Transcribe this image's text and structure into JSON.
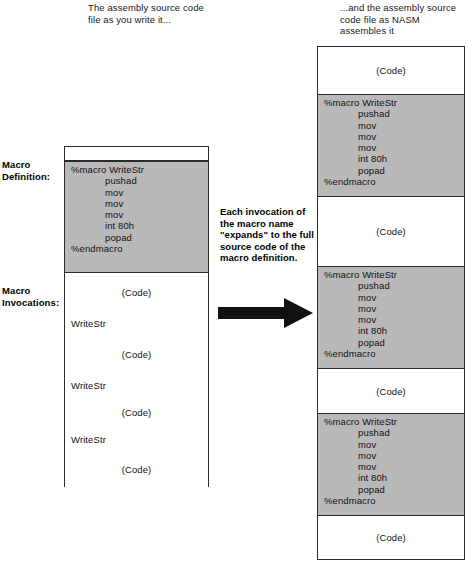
{
  "captions": {
    "left": "The assembly source code file as you write it...",
    "right": "...and the assembly source code file as NASM assembles it"
  },
  "labels": {
    "macro_definition": "Macro Definition:",
    "macro_invocations": "Macro Invocations:"
  },
  "center": {
    "note": "Each invocation of the macro name \"expands\" to the full source code of the macro definition.",
    "arrow_direction": "right"
  },
  "colors": {
    "macro_block_fill": "#b9b9b9",
    "code_block_fill": "#ffffff",
    "border": "#2b2b2b",
    "arrow": "#111111"
  },
  "macro_block": {
    "lines": [
      "%macro WriteStr",
      "pushad",
      "mov",
      "mov",
      "mov",
      "int 80h",
      "popad",
      "%endmacro"
    ],
    "indented": [
      false,
      true,
      true,
      true,
      true,
      true,
      true,
      false
    ]
  },
  "code_placeholder": "(Code)",
  "invocation_name": "WriteStr",
  "left_column": {
    "segments": [
      {
        "type": "blank"
      },
      {
        "type": "macro"
      },
      {
        "type": "code",
        "text": "(Code)"
      },
      {
        "type": "invoke",
        "text": "WriteStr"
      },
      {
        "type": "code",
        "text": "(Code)"
      },
      {
        "type": "invoke",
        "text": "WriteStr"
      },
      {
        "type": "code",
        "text": "(Code)"
      },
      {
        "type": "invoke",
        "text": "WriteStr"
      },
      {
        "type": "code",
        "text": "(Code)"
      }
    ]
  },
  "right_column": {
    "segments": [
      {
        "type": "code",
        "text": "(Code)"
      },
      {
        "type": "macro"
      },
      {
        "type": "code",
        "text": "(Code)"
      },
      {
        "type": "macro"
      },
      {
        "type": "code",
        "text": "(Code)"
      },
      {
        "type": "macro"
      },
      {
        "type": "code",
        "text": "(Code)"
      }
    ]
  }
}
